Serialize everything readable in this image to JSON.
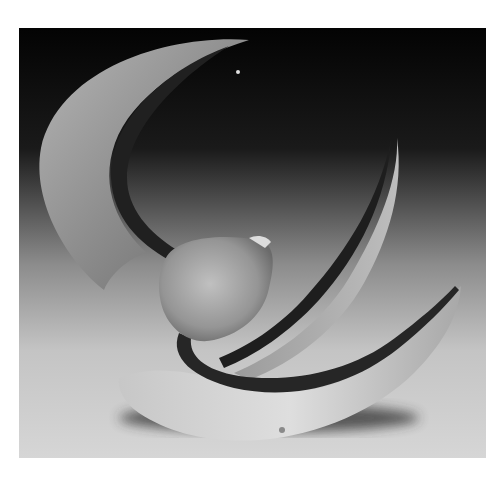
{
  "image": {
    "subject": "sculpture-photograph",
    "alt": "Grayscale photograph of an abstract sculpture made of curved seed-pod-like forms on a gradient backdrop",
    "palette": {
      "background_top": "#050505",
      "background_bottom": "#d8d8d8",
      "pod_light": "#c9c9c9",
      "pod_mid": "#9a9a9a",
      "stem_dark": "#2a2a2a",
      "shadow": "#3a3a3a"
    }
  }
}
